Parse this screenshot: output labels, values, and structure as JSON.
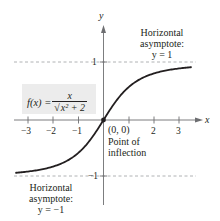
{
  "chart_data": {
    "type": "line",
    "title": "",
    "function": "f(x) = x / sqrt(x^2 + 2)",
    "xlabel": "x",
    "ylabel": "y",
    "xlim": [
      -3.5,
      3.5
    ],
    "ylim": [
      -1.4,
      1.6
    ],
    "x_ticks": [
      -3,
      -2,
      -1,
      2,
      3
    ],
    "x_tick_labels": [
      "−3",
      "−2",
      "−1",
      "2",
      "3"
    ],
    "y_ticks": [
      1,
      -1
    ],
    "y_tick_labels": [
      "1",
      "−1"
    ],
    "series": [
      {
        "name": "f(x) = x/√(x²+2)",
        "x": [
          -3.5,
          -3,
          -2,
          -1,
          0,
          1,
          2,
          3,
          3.5
        ],
        "values": [
          -0.927,
          -0.905,
          -0.816,
          -0.577,
          0,
          0.577,
          0.816,
          0.905,
          0.927
        ]
      }
    ],
    "asymptotes": [
      {
        "y": 1,
        "style": "dashed",
        "label": "Horizontal asymptote: y = 1"
      },
      {
        "y": -1,
        "style": "dashed",
        "label": "Horizontal asymptote: y = −1"
      }
    ],
    "annotations": [
      {
        "text": "(0, 0)",
        "x": 0,
        "y": 0
      },
      {
        "text": "Point of inflection",
        "x": 0,
        "y": 0
      }
    ],
    "grid": false,
    "legend": "none"
  },
  "labels": {
    "axis_x": "x",
    "axis_y": "y",
    "tick_neg3": "−3",
    "tick_neg2": "−2",
    "tick_neg1": "−1",
    "tick_2": "2",
    "tick_3": "3",
    "ytick_1": "1",
    "ytick_neg1": "−1",
    "asym_top_line1": "Horizontal",
    "asym_top_line2": "asymptote:",
    "asym_top_line3": "y = 1",
    "asym_bot_line1": "Horizontal",
    "asym_bot_line2": "asymptote:",
    "asym_bot_line3": "y = −1",
    "origin": "(0, 0)",
    "inflect_line1": "Point of",
    "inflect_line2": "inflection",
    "f_lhs": "f(x) =",
    "f_num": "x",
    "f_den_sqrt": "√",
    "f_den_body": "x² + 2"
  },
  "colors": {
    "curve": "#231f20",
    "axis": "#6d6e71",
    "dashed": "#a7a9ac",
    "formula_bg": "#ececec"
  }
}
